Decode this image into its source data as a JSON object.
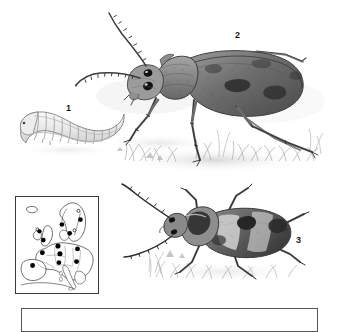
{
  "plate": {
    "title": "Longhorn beetle life stages plate",
    "background_color": "#ffffff",
    "ink_color": "#3a3a3a",
    "figure_labels": [
      {
        "id": "1",
        "text": "1",
        "subject": "larva-grub"
      },
      {
        "id": "2",
        "text": "2",
        "subject": "adult-beetle-lateral"
      },
      {
        "id": "3",
        "text": "3",
        "subject": "adult-beetle-dorsal"
      }
    ]
  },
  "figures": {
    "larva": {
      "label": "1",
      "description": "C-shaped segmented pale larva, left of plate",
      "segment_count": 12
    },
    "beetle_lateral": {
      "label": "2",
      "description": "Adult longhorn beetle, side view, long antennae, mottled elytra, standing on grass"
    },
    "beetle_dorsal": {
      "label": "3",
      "description": "Adult beetle, top-down view, banded elytra, on grass"
    }
  },
  "map": {
    "name": "europe-distribution-map",
    "border_color": "#3a3a3a",
    "dot_color": "#000000",
    "dot_count": 12,
    "dots": [
      {
        "x": 47,
        "y": 28
      },
      {
        "x": 66,
        "y": 23
      },
      {
        "x": 55,
        "y": 37
      },
      {
        "x": 24,
        "y": 35
      },
      {
        "x": 28,
        "y": 44
      },
      {
        "x": 43,
        "y": 50
      },
      {
        "x": 63,
        "y": 53
      },
      {
        "x": 27,
        "y": 57
      },
      {
        "x": 45,
        "y": 58
      },
      {
        "x": 62,
        "y": 66
      },
      {
        "x": 44,
        "y": 67
      },
      {
        "x": 17,
        "y": 70
      }
    ],
    "open_circles": [
      {
        "x": 64,
        "y": 14
      },
      {
        "x": 22,
        "y": 33
      },
      {
        "x": 60,
        "y": 34
      }
    ]
  },
  "caption": {
    "name": "caption-box",
    "text": ""
  }
}
